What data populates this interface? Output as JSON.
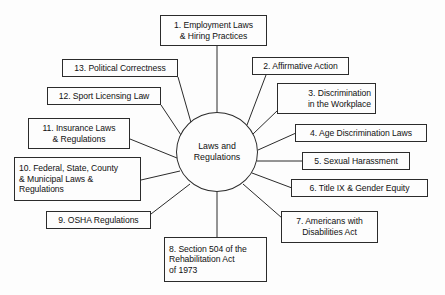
{
  "diagram": {
    "type": "radial-spider-diagram",
    "title_text": "Laws and Regulations",
    "background_color": "#fdfdfd",
    "line_color": "#2b2b2b",
    "text_color": "#111111",
    "hub": {
      "label_lines": [
        "Laws and",
        "Regulations"
      ],
      "center_x": 217,
      "center_y": 152,
      "radius_x": 41,
      "radius_y": 40
    },
    "nodes": [
      {
        "number": "1",
        "lines": [
          "1. Employment Laws",
          "& Hiring Practices"
        ],
        "align": "center",
        "x": 160,
        "y": 15,
        "w": 107,
        "h": 31
      },
      {
        "number": "2",
        "lines": [
          "2. Affirmative Action"
        ],
        "align": "center",
        "x": 252,
        "y": 57,
        "w": 97,
        "h": 18
      },
      {
        "number": "3",
        "lines": [
          "3. Discrimination",
          "in the Workplace"
        ],
        "align": "right",
        "x": 277,
        "y": 83,
        "w": 99,
        "h": 31
      },
      {
        "number": "4",
        "lines": [
          "4. Age Discrimination Laws"
        ],
        "align": "center",
        "x": 295,
        "y": 124,
        "w": 132,
        "h": 18
      },
      {
        "number": "5",
        "lines": [
          "5. Sexual Harassment"
        ],
        "align": "center",
        "x": 302,
        "y": 152,
        "w": 108,
        "h": 18
      },
      {
        "number": "6",
        "lines": [
          "6. Title IX & Gender Equity"
        ],
        "align": "center",
        "x": 291,
        "y": 179,
        "w": 137,
        "h": 18
      },
      {
        "number": "7",
        "lines": [
          "7. Americans with",
          "Disabilities Act"
        ],
        "align": "center",
        "x": 281,
        "y": 211,
        "w": 97,
        "h": 32
      },
      {
        "number": "8",
        "lines": [
          "8. Section 504 of the",
          "Rehabilitation Act",
          "of 1973"
        ],
        "align": "left",
        "x": 164,
        "y": 237,
        "w": 103,
        "h": 45
      },
      {
        "number": "9",
        "lines": [
          "9. OSHA Regulations"
        ],
        "align": "center",
        "x": 46,
        "y": 211,
        "w": 105,
        "h": 18
      },
      {
        "number": "10",
        "lines": [
          "10. Federal, State, County",
          "& Municipal Laws &",
          "Regulations"
        ],
        "align": "left",
        "x": 14,
        "y": 157,
        "w": 127,
        "h": 44
      },
      {
        "number": "11",
        "lines": [
          "11. Insurance Laws",
          "& Regulations"
        ],
        "align": "center",
        "x": 28,
        "y": 118,
        "w": 102,
        "h": 31
      },
      {
        "number": "12",
        "lines": [
          "12. Sport Licensing Law"
        ],
        "align": "center",
        "x": 47,
        "y": 87,
        "w": 114,
        "h": 18
      },
      {
        "number": "13",
        "lines": [
          "13. Political Correctness"
        ],
        "align": "center",
        "x": 62,
        "y": 59,
        "w": 116,
        "h": 18
      }
    ],
    "edges": [
      {
        "from": "hub",
        "to": "1",
        "x1": 217,
        "y1": 112,
        "x2": 217,
        "y2": 46
      },
      {
        "from": "hub",
        "to": "2",
        "x1": 247,
        "y1": 125,
        "x2": 266,
        "y2": 75
      },
      {
        "from": "hub",
        "to": "3",
        "x1": 253,
        "y1": 134,
        "x2": 278,
        "y2": 110
      },
      {
        "from": "hub",
        "to": "4",
        "x1": 258,
        "y1": 150,
        "x2": 296,
        "y2": 133
      },
      {
        "from": "hub",
        "to": "5",
        "x1": 257,
        "y1": 161,
        "x2": 303,
        "y2": 161
      },
      {
        "from": "hub",
        "to": "6",
        "x1": 252,
        "y1": 173,
        "x2": 292,
        "y2": 188
      },
      {
        "from": "hub",
        "to": "7",
        "x1": 243,
        "y1": 184,
        "x2": 282,
        "y2": 218
      },
      {
        "from": "hub",
        "to": "8",
        "x1": 217,
        "y1": 192,
        "x2": 217,
        "y2": 238
      },
      {
        "from": "hub",
        "to": "9",
        "x1": 190,
        "y1": 184,
        "x2": 151,
        "y2": 214
      },
      {
        "from": "hub",
        "to": "10",
        "x1": 180,
        "y1": 171,
        "x2": 141,
        "y2": 180
      },
      {
        "from": "hub",
        "to": "11",
        "x1": 177,
        "y1": 158,
        "x2": 130,
        "y2": 139
      },
      {
        "from": "hub",
        "to": "12",
        "x1": 183,
        "y1": 138,
        "x2": 161,
        "y2": 105
      },
      {
        "from": "hub",
        "to": "13",
        "x1": 192,
        "y1": 126,
        "x2": 178,
        "y2": 77
      }
    ]
  }
}
